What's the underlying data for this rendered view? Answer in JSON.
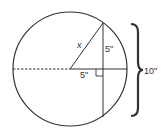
{
  "diagram": {
    "type": "circle-chord-geometry",
    "labels": {
      "radius": "x",
      "half_chord": "5\"",
      "center_distance": "5\"",
      "chord_length": "10\""
    },
    "colors": {
      "stroke": "#333333",
      "background": "#ffffff"
    }
  }
}
